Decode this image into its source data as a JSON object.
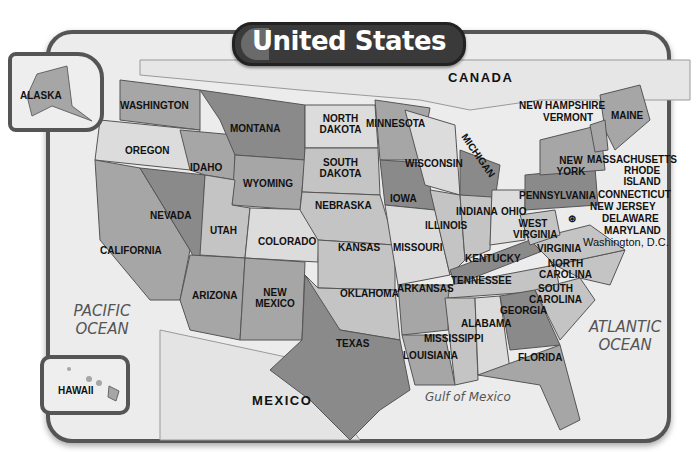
{
  "title": "United States",
  "countries": {
    "canada": "CANADA",
    "mexico": "MEXICO"
  },
  "oceans": {
    "pacific": "PACIFIC OCEAN",
    "atlantic": "ATLANTIC OCEAN",
    "gulf": "Gulf of Mexico"
  },
  "insets": {
    "alaska": "ALASKA",
    "hawaii": "HAWAII"
  },
  "capital": "Washington, D.C.",
  "states": {
    "washington": "WASHINGTON",
    "oregon": "OREGON",
    "california": "CALIFORNIA",
    "nevada": "NEVADA",
    "idaho": "IDAHO",
    "montana": "MONTANA",
    "wyoming": "WYOMING",
    "utah": "UTAH",
    "colorado": "COLORADO",
    "arizona": "ARIZONA",
    "new_mexico": "NEW MEXICO",
    "north_dakota": "NORTH DAKOTA",
    "south_dakota": "SOUTH DAKOTA",
    "nebraska": "NEBRASKA",
    "kansas": "KANSAS",
    "oklahoma": "OKLAHOMA",
    "texas": "TEXAS",
    "minnesota": "MINNESOTA",
    "iowa": "IOWA",
    "missouri": "MISSOURI",
    "arkansas": "ARKANSAS",
    "louisiana": "LOUISIANA",
    "wisconsin": "WISCONSIN",
    "michigan": "MICHIGAN",
    "illinois": "ILLINOIS",
    "indiana": "INDIANA",
    "ohio": "OHIO",
    "kentucky": "KENTUCKY",
    "tennessee": "TENNESSEE",
    "mississippi": "MISSISSIPPI",
    "alabama": "ALABAMA",
    "georgia": "GEORGIA",
    "florida": "FLORIDA",
    "south_carolina": "SOUTH CAROLINA",
    "north_carolina": "NORTH CAROLINA",
    "virginia": "VIRGINIA",
    "west_virginia": "WEST VIRGINIA",
    "pennsylvania": "PENNSYLVANIA",
    "new_york": "NEW YORK",
    "maryland": "MARYLAND",
    "delaware": "DELAWARE",
    "new_jersey": "NEW JERSEY",
    "connecticut": "CONNECTICUT",
    "rhode_island": "RHODE ISLAND",
    "massachusetts": "MASSACHUSETTS",
    "vermont": "VERMONT",
    "new_hampshire": "NEW HAMPSHIRE",
    "maine": "MAINE"
  },
  "colors": {
    "frame": "#555555",
    "water": "#ececec",
    "dark": "#8a8a8a",
    "mid": "#a6a6a6",
    "light": "#c4c4c4",
    "pale": "#dcdcdc",
    "title_bg": "#3a3a3a"
  }
}
